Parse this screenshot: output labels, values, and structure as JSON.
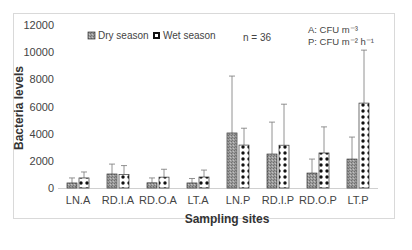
{
  "chart_data": {
    "type": "bar",
    "title": "",
    "xlabel": "Sampling sites",
    "ylabel": "Bacteria levels",
    "ylim": [
      0,
      12000
    ],
    "yticks": [
      0,
      2000,
      4000,
      6000,
      8000,
      10000,
      12000
    ],
    "grid": false,
    "legend_position": "top-left inside",
    "categories": [
      "LN.A",
      "RD.I.A",
      "RD.O.A",
      "LT.A",
      "LN.P",
      "RD.I.P",
      "RD.O.P",
      "LT.P"
    ],
    "series": [
      {
        "name": "Dry season",
        "values": [
          370,
          1030,
          380,
          370,
          4050,
          2500,
          1100,
          2130
        ],
        "error_upper": [
          740,
          1760,
          740,
          700,
          8240,
          4850,
          2130,
          3750
        ]
      },
      {
        "name": "Wet season",
        "values": [
          740,
          1000,
          800,
          810,
          3160,
          3150,
          2580,
          6250
        ],
        "error_upper": [
          1180,
          1650,
          1380,
          1320,
          4400,
          6170,
          4500,
          10150
        ]
      }
    ],
    "annotations": [
      "n = 36",
      "A: CFU m⁻³",
      "P: CFU m⁻² h⁻¹"
    ]
  },
  "legend": {
    "dry": "Dry season",
    "wet": "Wet season"
  },
  "note_n": "n = 36",
  "unit_a": "A: CFU m⁻³",
  "unit_p": "P: CFU m⁻² h⁻¹",
  "colors": {
    "dry": "#8c8c8c",
    "wet_bg": "#ffffff",
    "wet_dot": "#111111",
    "axis": "#d0d0d0",
    "frame": "#d9d9d9"
  }
}
